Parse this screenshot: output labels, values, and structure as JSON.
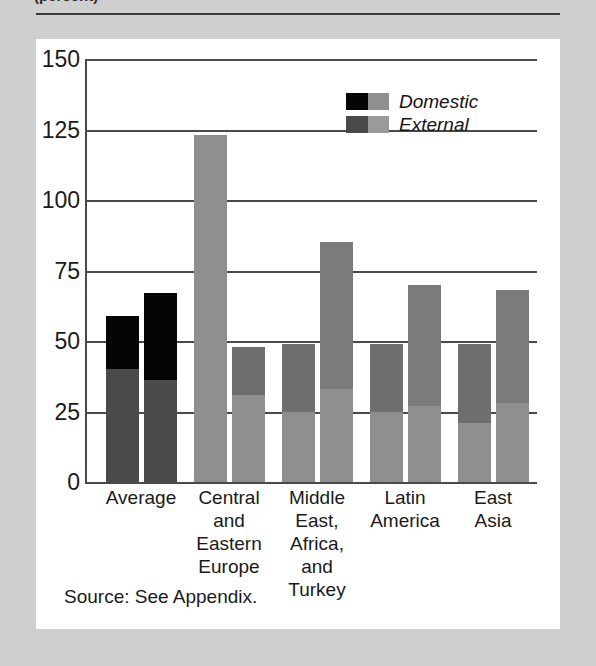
{
  "figure": {
    "title": "(percent)",
    "source_note": "Source: See Appendix."
  },
  "legend": {
    "position": "top-right",
    "items": [
      {
        "label": "Domestic",
        "color_dark": "#050505",
        "color_light": "#8f8f8f"
      },
      {
        "label": "External",
        "color_dark": "#4a4a4a",
        "color_light": "#9a9a9a"
      }
    ]
  },
  "chart_data": {
    "type": "bar",
    "title": "(percent)",
    "xlabel": "",
    "ylabel": "",
    "ylim": [
      0,
      150
    ],
    "yticks": [
      0,
      25,
      50,
      75,
      100,
      125,
      150
    ],
    "ytick_labels": [
      "0",
      "25",
      "50",
      "75",
      "100",
      "125",
      "150"
    ],
    "grid": true,
    "stacked": true,
    "categories": [
      "Average",
      "Central and Eastern Europe",
      "Middle East, Africa, and Turkey",
      "Latin America",
      "East Asia"
    ],
    "category_label_lines": [
      [
        "Average"
      ],
      [
        "Central",
        "and",
        "Eastern",
        "Europe"
      ],
      [
        "Middle",
        "East,",
        "Africa,",
        "and",
        "Turkey"
      ],
      [
        "Latin",
        "America"
      ],
      [
        "East",
        "Asia"
      ]
    ],
    "series": [
      {
        "name": "Domestic",
        "values": [
          59,
          123,
          49,
          49,
          49
        ],
        "lower_segment": [
          40,
          123,
          25,
          25,
          21
        ],
        "upper_segment": [
          19,
          0,
          24,
          24,
          28
        ]
      },
      {
        "name": "External",
        "values": [
          67,
          48,
          85,
          70,
          68
        ],
        "lower_segment": [
          36,
          31,
          33,
          27,
          28
        ],
        "upper_segment": [
          31,
          17,
          52,
          43,
          40
        ]
      }
    ],
    "bars": [
      {
        "group": "Average",
        "series": "Domestic",
        "total": 59,
        "segments": [
          {
            "value": 40,
            "color": "#4a4a4a"
          },
          {
            "value": 19,
            "color": "#050505"
          }
        ]
      },
      {
        "group": "Average",
        "series": "External",
        "total": 67,
        "segments": [
          {
            "value": 36,
            "color": "#4a4a4a"
          },
          {
            "value": 31,
            "color": "#050505"
          }
        ]
      },
      {
        "group": "Central and Eastern Europe",
        "series": "Domestic",
        "total": 123,
        "segments": [
          {
            "value": 123,
            "color": "#8f8f8f"
          }
        ]
      },
      {
        "group": "Central and Eastern Europe",
        "series": "External",
        "total": 48,
        "segments": [
          {
            "value": 31,
            "color": "#8f8f8f"
          },
          {
            "value": 17,
            "color": "#6e6e6e"
          }
        ]
      },
      {
        "group": "Middle East, Africa, and Turkey",
        "series": "Domestic",
        "total": 49,
        "segments": [
          {
            "value": 25,
            "color": "#8f8f8f"
          },
          {
            "value": 24,
            "color": "#6e6e6e"
          }
        ]
      },
      {
        "group": "Middle East, Africa, and Turkey",
        "series": "External",
        "total": 85,
        "segments": [
          {
            "value": 33,
            "color": "#8f8f8f"
          },
          {
            "value": 52,
            "color": "#7b7b7b"
          }
        ]
      },
      {
        "group": "Latin America",
        "series": "Domestic",
        "total": 49,
        "segments": [
          {
            "value": 25,
            "color": "#8f8f8f"
          },
          {
            "value": 24,
            "color": "#6e6e6e"
          }
        ]
      },
      {
        "group": "Latin America",
        "series": "External",
        "total": 70,
        "segments": [
          {
            "value": 27,
            "color": "#8f8f8f"
          },
          {
            "value": 43,
            "color": "#7b7b7b"
          }
        ]
      },
      {
        "group": "East Asia",
        "series": "Domestic",
        "total": 49,
        "segments": [
          {
            "value": 21,
            "color": "#8f8f8f"
          },
          {
            "value": 28,
            "color": "#6e6e6e"
          }
        ]
      },
      {
        "group": "East Asia",
        "series": "External",
        "total": 68,
        "segments": [
          {
            "value": 28,
            "color": "#8f8f8f"
          },
          {
            "value": 40,
            "color": "#7b7b7b"
          }
        ]
      }
    ]
  }
}
